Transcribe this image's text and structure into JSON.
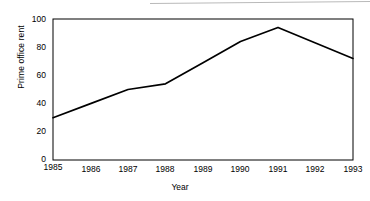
{
  "chart_data": {
    "type": "line",
    "title": "",
    "xlabel": "Year",
    "ylabel": "Prime office rent",
    "categories": [
      "1985",
      "1986",
      "1987",
      "1988",
      "1989",
      "1990",
      "1991",
      "1992",
      "1993"
    ],
    "x": [
      1985,
      1986,
      1987,
      1988,
      1989,
      1990,
      1991,
      1992,
      1993
    ],
    "values": [
      30,
      40,
      50,
      54,
      69,
      84,
      94,
      83,
      72
    ],
    "series": [
      {
        "name": "Prime office rent",
        "values": [
          30,
          40,
          50,
          54,
          69,
          84,
          94,
          83,
          72
        ]
      }
    ],
    "xlim": [
      1985,
      1993
    ],
    "ylim": [
      0,
      100
    ],
    "yticks": [
      "0",
      "20",
      "40",
      "60",
      "80",
      "100"
    ],
    "ytick_values": [
      0,
      20,
      40,
      60,
      80,
      100
    ],
    "xticks": [
      "1985",
      "1986",
      "1987",
      "1988",
      "1989",
      "1990",
      "1991",
      "1992",
      "1993"
    ],
    "grid": false,
    "legend": false,
    "line_color": "#000000",
    "axis_color": "#000000",
    "background_color": "#ffffff"
  }
}
